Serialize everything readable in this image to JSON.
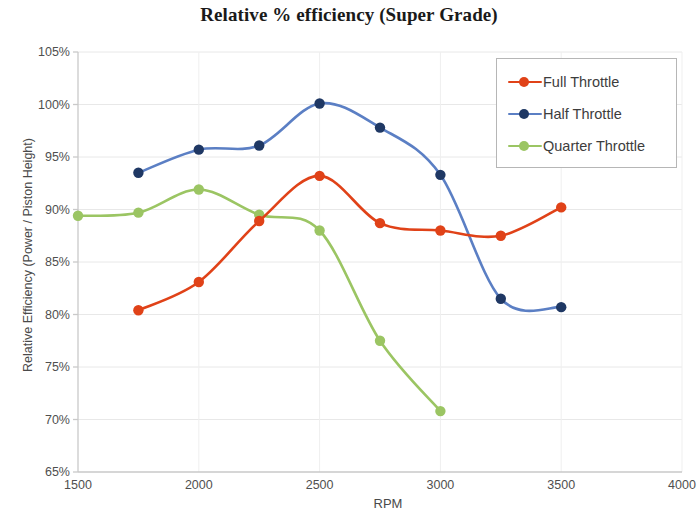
{
  "chart_data": {
    "type": "line",
    "title": "Relative % efficiency (Super Grade)",
    "xlabel": "RPM",
    "ylabel": "Relative Efficiency (Power / Piston Height)",
    "xlim": [
      1500,
      4000
    ],
    "ylim": [
      65,
      105
    ],
    "xticks": [
      1500,
      2000,
      2500,
      3000,
      3500,
      4000
    ],
    "xtick_labels": [
      "1500",
      "2000",
      "2500",
      "3000",
      "3500",
      "4000"
    ],
    "yticks": [
      65,
      70,
      75,
      80,
      85,
      90,
      95,
      100,
      105
    ],
    "ytick_labels": [
      "65%",
      "70%",
      "75%",
      "80%",
      "85%",
      "90%",
      "95%",
      "100%",
      "105%"
    ],
    "grid": true,
    "legend_position": "top-right",
    "smoothing": "spline",
    "series": [
      {
        "name": "Full Throttle",
        "color": "#E04218",
        "marker_color": "#E04218",
        "x": [
          1750,
          2000,
          2250,
          2500,
          2750,
          3000,
          3250,
          3500
        ],
        "values": [
          80.4,
          83.1,
          88.9,
          93.2,
          88.7,
          88.0,
          87.5,
          90.2
        ]
      },
      {
        "name": "Half Throttle",
        "color": "#5B7FC4",
        "marker_color": "#1F3864",
        "x": [
          1750,
          2000,
          2250,
          2500,
          2750,
          3000,
          3250,
          3500
        ],
        "values": [
          93.5,
          95.7,
          96.1,
          100.1,
          97.8,
          93.3,
          81.5,
          80.7
        ]
      },
      {
        "name": "Quarter Throttle",
        "color": "#9BC563",
        "marker_color": "#9BC563",
        "x": [
          1500,
          1750,
          2000,
          2250,
          2500,
          2750,
          3000
        ],
        "values": [
          89.4,
          89.7,
          91.9,
          89.5,
          88.0,
          77.5,
          70.8
        ]
      }
    ]
  },
  "legend": {
    "items": [
      {
        "label": "Full Throttle"
      },
      {
        "label": "Half Throttle"
      },
      {
        "label": "Quarter Throttle"
      }
    ]
  }
}
